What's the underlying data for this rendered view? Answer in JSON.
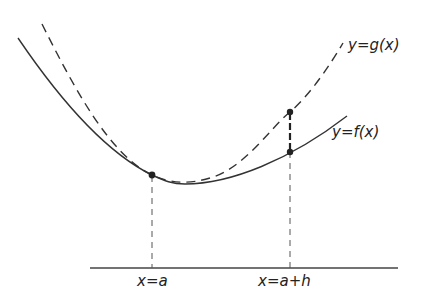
{
  "figure": {
    "curves": [
      {
        "id": "g",
        "label": "y=g(x)",
        "style": "dashed"
      },
      {
        "id": "f",
        "label": "y=f(x)",
        "style": "solid"
      }
    ],
    "axis_labels": {
      "a": "x=a",
      "a_plus_h": "x=a+h"
    },
    "colors": {
      "stroke": "#333333",
      "background": "#ffffff"
    }
  }
}
